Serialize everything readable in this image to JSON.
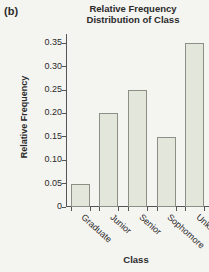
{
  "panel": {
    "label": "(b)"
  },
  "chart_data": {
    "type": "bar",
    "title": "Relative Frequency Distribution of Class",
    "title_lines": [
      "Relative Frequency",
      "Distribution of Class"
    ],
    "xlabel": "Class",
    "ylabel": "Relative Frequency",
    "categories": [
      "Graduate",
      "Junior",
      "Senior",
      "Sophomore",
      "Unknown"
    ],
    "values": [
      0.05,
      0.2,
      0.25,
      0.15,
      0.35
    ],
    "ylim": [
      0,
      0.37
    ],
    "yticks": [
      0,
      0.05,
      0.1,
      0.15,
      0.2,
      0.25,
      0.3,
      0.35
    ],
    "ytick_labels": [
      "0",
      "0.05",
      "0.10",
      "0.15",
      "0.20",
      "0.25",
      "0.30",
      "0.35"
    ],
    "grid": false,
    "legend": false,
    "bar_fill_color": "#e3e7db",
    "bar_edge_color": "#8d8f86",
    "axis_color": "#555555",
    "background_color": "#f4f4f1"
  }
}
